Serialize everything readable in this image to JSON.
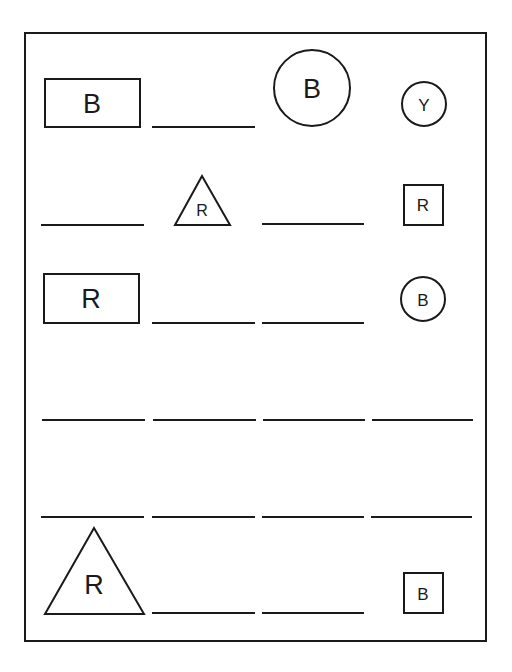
{
  "worksheet": {
    "grid_columns": 4,
    "grid_rows": 6,
    "cells": [
      {
        "row": 1,
        "col": 1,
        "kind": "shape",
        "shape": "rectangle",
        "letter": "B"
      },
      {
        "row": 1,
        "col": 2,
        "kind": "blank"
      },
      {
        "row": 1,
        "col": 3,
        "kind": "shape",
        "shape": "circle",
        "letter": "B"
      },
      {
        "row": 1,
        "col": 4,
        "kind": "shape",
        "shape": "circle",
        "letter": "Y"
      },
      {
        "row": 2,
        "col": 1,
        "kind": "blank"
      },
      {
        "row": 2,
        "col": 2,
        "kind": "shape",
        "shape": "triangle",
        "letter": "R"
      },
      {
        "row": 2,
        "col": 3,
        "kind": "blank"
      },
      {
        "row": 2,
        "col": 4,
        "kind": "shape",
        "shape": "square",
        "letter": "R"
      },
      {
        "row": 3,
        "col": 1,
        "kind": "shape",
        "shape": "rectangle",
        "letter": "R"
      },
      {
        "row": 3,
        "col": 2,
        "kind": "blank"
      },
      {
        "row": 3,
        "col": 3,
        "kind": "blank"
      },
      {
        "row": 3,
        "col": 4,
        "kind": "shape",
        "shape": "circle",
        "letter": "B"
      },
      {
        "row": 4,
        "col": 1,
        "kind": "blank"
      },
      {
        "row": 4,
        "col": 2,
        "kind": "blank"
      },
      {
        "row": 4,
        "col": 3,
        "kind": "blank"
      },
      {
        "row": 4,
        "col": 4,
        "kind": "blank"
      },
      {
        "row": 5,
        "col": 1,
        "kind": "blank"
      },
      {
        "row": 5,
        "col": 2,
        "kind": "blank"
      },
      {
        "row": 5,
        "col": 3,
        "kind": "blank"
      },
      {
        "row": 5,
        "col": 4,
        "kind": "blank"
      },
      {
        "row": 6,
        "col": 1,
        "kind": "shape",
        "shape": "triangle",
        "letter": "R"
      },
      {
        "row": 6,
        "col": 2,
        "kind": "blank"
      },
      {
        "row": 6,
        "col": 3,
        "kind": "blank"
      },
      {
        "row": 6,
        "col": 4,
        "kind": "shape",
        "shape": "square",
        "letter": "B"
      }
    ]
  }
}
